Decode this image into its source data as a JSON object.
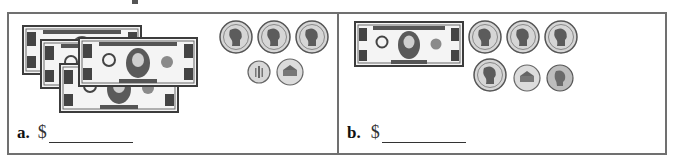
{
  "problems": [
    {
      "label": "a.",
      "currency_symbol": "$",
      "answer_value": "",
      "items": {
        "bills": [
          {
            "type": "five-dollar-bill",
            "denomination": "5",
            "text": "THE UNITED STATES OF AMERICA"
          },
          {
            "type": "one-dollar-bill",
            "denomination": "1",
            "text": "ONE DOLLAR"
          },
          {
            "type": "one-dollar-bill",
            "denomination": "1",
            "text": "ONE DOLLAR"
          },
          {
            "type": "one-dollar-bill",
            "denomination": "1",
            "text": "ONE DOLLAR"
          }
        ],
        "coins": [
          "quarter",
          "quarter",
          "quarter",
          "dime",
          "nickel"
        ]
      }
    },
    {
      "label": "b.",
      "currency_symbol": "$",
      "answer_value": "",
      "items": {
        "bills": [
          {
            "type": "one-dollar-bill",
            "denomination": "1",
            "text": "ONE DOLLAR"
          }
        ],
        "coins": [
          "quarter",
          "quarter",
          "quarter",
          "quarter",
          "nickel",
          "penny"
        ]
      }
    }
  ],
  "colors": {
    "border": "#707070",
    "bill": "#4a4a4a",
    "coin": "#9a9a9a"
  }
}
